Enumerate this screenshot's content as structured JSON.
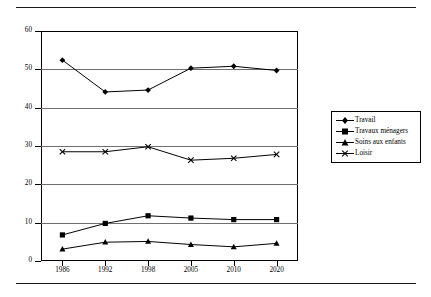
{
  "chart_data": {
    "type": "line",
    "title": "",
    "xlabel": "",
    "ylabel": "",
    "categories": [
      "1986",
      "1992",
      "1998",
      "2005",
      "2010",
      "2020"
    ],
    "ylim": [
      0,
      60
    ],
    "yticks": [
      0,
      10,
      20,
      30,
      40,
      50,
      60
    ],
    "grid": true,
    "legend_position": "right",
    "series": [
      {
        "name": "Travail",
        "marker": "diamond",
        "color": "#000000",
        "values": [
          52.4,
          44.1,
          44.6,
          50.3,
          50.8,
          49.7
        ]
      },
      {
        "name": "Travaux ménagers",
        "marker": "square",
        "color": "#000000",
        "values": [
          6.8,
          9.8,
          11.8,
          11.2,
          10.8,
          10.8
        ]
      },
      {
        "name": "Soins aux enfants",
        "marker": "triangle",
        "color": "#000000",
        "values": [
          3.1,
          4.9,
          5.1,
          4.3,
          3.7,
          4.6
        ]
      },
      {
        "name": "Loisir",
        "marker": "cross",
        "color": "#000000",
        "values": [
          28.5,
          28.5,
          29.8,
          26.3,
          26.8,
          27.8
        ]
      }
    ]
  },
  "legend": {
    "items": [
      {
        "label": "Travail"
      },
      {
        "label": "Travaux ménagers"
      },
      {
        "label": "Soins aux enfants"
      },
      {
        "label": "Loisir"
      }
    ]
  },
  "axis": {
    "y_labels": [
      "60",
      "50",
      "40",
      "30",
      "20",
      "10",
      "0"
    ],
    "x_labels": [
      "1986",
      "1992",
      "1998",
      "2005",
      "2010",
      "2020"
    ]
  }
}
